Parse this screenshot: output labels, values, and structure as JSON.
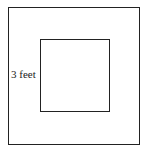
{
  "diagram": {
    "type": "nested-squares",
    "outer_square": {
      "label": ""
    },
    "inner_square": {
      "label": ""
    },
    "gap_label": "3 feet",
    "stroke_color": "#222222",
    "background_color": "#ffffff"
  }
}
